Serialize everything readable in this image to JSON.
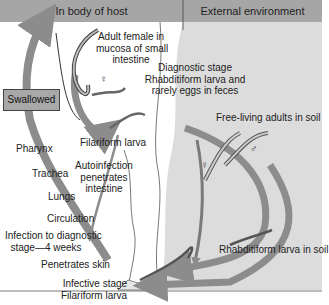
{
  "diagram": {
    "type": "life-cycle",
    "colors": {
      "header": "#a6a6a6",
      "external_bg": "#dcdcdc",
      "arrow": "#8c8c8c",
      "swallowed_box": "#a8a8a8"
    },
    "header": {
      "host_label": "In body of host",
      "external_label": "External environment"
    },
    "host_labels": {
      "adult_female": [
        "Adult female in",
        "mucosa of small",
        "intestine"
      ],
      "swallowed": "Swallowed",
      "pharynx": "Pharynx",
      "trachea": "Trachea",
      "lungs": "Lungs",
      "circulation": "Circulation",
      "infection_time": [
        "Infection to diagnostic",
        "stage—4 weeks"
      ],
      "penetrates_skin": "Penetrates skin",
      "infective_stage": [
        "Infective stage",
        "Filariform larva"
      ],
      "filariform_larva": "Filariform larva",
      "autoinfection": [
        "Autoinfection",
        "penetrates",
        "intestine"
      ]
    },
    "external_labels": {
      "diagnostic_stage": [
        "Diagnostic stage",
        "Rhabditiform larva and",
        "rarely eggs in feces"
      ],
      "free_living": "Free-living adults in soil",
      "rhabditiform_soil": "Rhabditiform larva in soil"
    },
    "symbols": {
      "female": "♀",
      "male": "♂"
    }
  }
}
